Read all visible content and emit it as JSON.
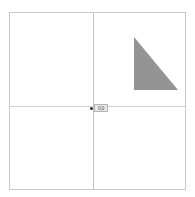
{
  "canvas": {
    "background_color": "#ffffff",
    "border_color": "#c9c9c9",
    "width_px": 177,
    "height_px": 178
  },
  "axes": {
    "vertical": {
      "name": "vertical-axis",
      "color": "#c6c6c6",
      "x_px": 83
    },
    "horizontal": {
      "name": "horizontal-axis",
      "color": "#cfcfcf",
      "y_px": 93
    }
  },
  "origin": {
    "marker_color": "#2e2e2e",
    "label_text": "0,0",
    "label_bg": "#e8e8e8",
    "label_border": "#b4b4b4"
  },
  "shapes": [
    {
      "name": "right-triangle",
      "type": "polygon",
      "fill": "#949494",
      "stroke": "none",
      "points": "124,24 124,77 168,77",
      "description": "right triangle, right angle at bottom-left, hypotenuse top-left to bottom-right"
    }
  ]
}
